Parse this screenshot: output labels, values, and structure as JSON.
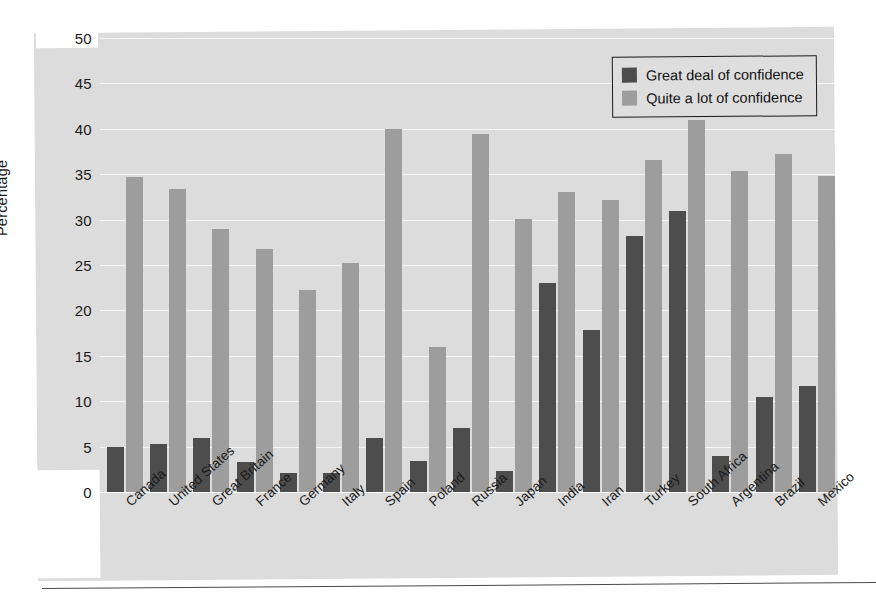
{
  "chart_data": {
    "type": "bar",
    "title": "",
    "subtitle": "",
    "xlabel": "",
    "ylabel": "Percentage",
    "ylim": [
      0,
      50
    ],
    "yticks": [
      0,
      5,
      10,
      15,
      20,
      25,
      30,
      35,
      40,
      45,
      50
    ],
    "grid": true,
    "legend_position": "top-right",
    "categories": [
      "Canada",
      "United States",
      "Great Britain",
      "France",
      "Germany",
      "Italy",
      "Spain",
      "Poland",
      "Russia",
      "Japan",
      "India",
      "Iran",
      "Turkey",
      "South Africa",
      "Argentina",
      "Brazil",
      "Mexico"
    ],
    "series": [
      {
        "name": "Great deal of confidence",
        "color": "#4d4d4d",
        "values": [
          5.0,
          5.3,
          6.0,
          3.3,
          2.1,
          2.1,
          6.0,
          3.4,
          7.0,
          2.3,
          23.0,
          17.8,
          28.2,
          31.0,
          4.0,
          10.5,
          11.7
        ]
      },
      {
        "name": "Quite a lot of confidence",
        "color": "#9d9d9d",
        "values": [
          34.7,
          33.4,
          29.0,
          26.8,
          22.3,
          25.2,
          40.0,
          16.0,
          39.4,
          30.1,
          33.0,
          32.2,
          36.6,
          41.0,
          35.4,
          37.2,
          34.8
        ]
      }
    ]
  },
  "legend": {
    "items": [
      {
        "label": "Great deal of confidence",
        "swatch": "dark"
      },
      {
        "label": "Quite a lot of confidence",
        "swatch": "light"
      }
    ]
  },
  "colors": {
    "series_dark": "#4d4d4d",
    "series_light": "#9d9d9d",
    "panel_background": "#dcdcdc",
    "text": "#1a1a1a",
    "gridline": "#ffffff"
  }
}
